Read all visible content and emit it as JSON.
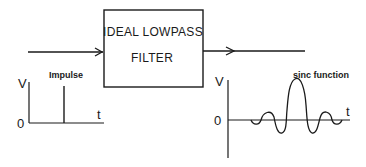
{
  "filter_box": {
    "line1": "IDEAL LOWPASS",
    "line2": "FILTER"
  },
  "input_graph": {
    "title": "Impulse",
    "y_label": "V",
    "x_label": "t",
    "origin_label": "0"
  },
  "output_graph": {
    "title": "sinc function",
    "y_label": "V",
    "x_label": "t",
    "origin_label": "0"
  },
  "colors": {
    "stroke": "#1a1a1a",
    "background": "#ffffff"
  }
}
